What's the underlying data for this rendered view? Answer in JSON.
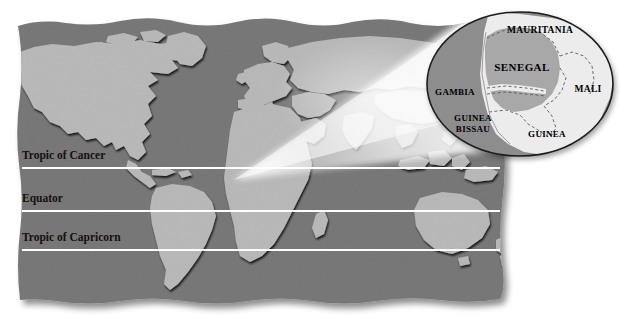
{
  "figure": {
    "kind": "world-map-with-locator-inset",
    "background_color": "#ffffff"
  },
  "colors": {
    "ocean": "#767676",
    "land": "#b8b8b8",
    "land_dark_edge": "#3d3d3d",
    "latitude_line": "#ffffff",
    "label_text": "#15100c",
    "inset_outline": "#1b1b1b",
    "inset_ocean": "#8d8d8d",
    "inset_land_neighbor": "#ececec",
    "inset_highlight": "#a8a8a8",
    "inset_border_dash": "#5a5a5a",
    "beam_light": "#ffffff",
    "shadow": "#c9c9c9"
  },
  "world_map": {
    "latitude_lines": [
      {
        "name": "Tropic of Cancer",
        "label": "Tropic of Cancer",
        "y": 168,
        "label_x": 22,
        "label_y": 159
      },
      {
        "name": "Equator",
        "label": "Equator",
        "y": 211,
        "label_x": 22,
        "label_y": 202
      },
      {
        "name": "Tropic of Capricorn",
        "label": "Tropic of Capricorn",
        "y": 250,
        "label_x": 22,
        "label_y": 241
      }
    ],
    "line_start_x": 22,
    "line_end_x": 500
  },
  "inset": {
    "shape": "ellipse",
    "center_x": 520,
    "center_y": 84,
    "radius_x": 93,
    "radius_y": 72,
    "highlighted_country": "SENEGAL",
    "labels": [
      {
        "text": "MAURITANIA",
        "x": 540,
        "y": 33,
        "size": "cl-mid"
      },
      {
        "text": "SENEGAL",
        "x": 522,
        "y": 71,
        "size": "cl-big"
      },
      {
        "text": "GAMBIA",
        "x": 455,
        "y": 95,
        "size": "cl-sm"
      },
      {
        "text": "MALI",
        "x": 588,
        "y": 92,
        "size": "cl-mid"
      },
      {
        "text": "GUINEA",
        "x": 473,
        "y": 121,
        "size": "cl-sm"
      },
      {
        "text": "BISSAU",
        "x": 473,
        "y": 132,
        "size": "cl-sm"
      },
      {
        "text": "GUINEA",
        "x": 547,
        "y": 137,
        "size": "cl-sm"
      }
    ]
  },
  "magnifier_beam": {
    "apex_x": 234,
    "apex_y": 180,
    "description": "light cone from West Africa to inset"
  }
}
